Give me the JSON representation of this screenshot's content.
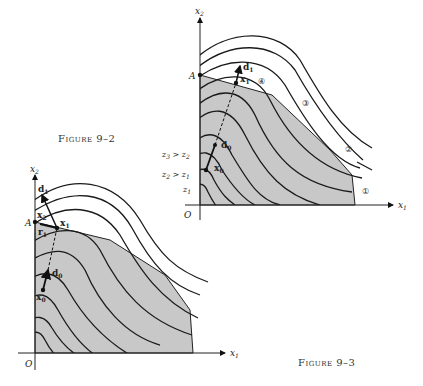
{
  "figures": [
    {
      "id": "fig-9-2",
      "caption": "Figure 9–2",
      "axes": {
        "x": "x",
        "x_sub": "1",
        "y": "x",
        "y_sub": "2",
        "origin": "O"
      },
      "points": {
        "A": "A",
        "x0": "x",
        "x0_sub": "0",
        "x1": "x",
        "x1_sub": "1",
        "d0": "d",
        "d0_sub": "0",
        "d1": "d",
        "d1_sub": "1"
      },
      "level_labels": [
        {
          "text": "z",
          "sub": "3",
          "rel": " > z",
          "rel_sub": "2"
        },
        {
          "text": "z",
          "sub": "2",
          "rel": " > z",
          "rel_sub": "1"
        },
        {
          "text": "z",
          "sub": "1",
          "rel": "",
          "rel_sub": ""
        }
      ],
      "circled_labels": [
        "①",
        "②",
        "③",
        "④"
      ]
    },
    {
      "id": "fig-9-3",
      "caption": "Figure 9–3",
      "axes": {
        "x": "x",
        "x_sub": "1",
        "y": "x",
        "y_sub": "2",
        "origin": "O"
      },
      "points": {
        "A": "A",
        "x0": "x",
        "x0_sub": "0",
        "x1": "x",
        "x1_sub": "1",
        "x2": "x",
        "x2_sub": "2",
        "d0": "d",
        "d0_sub": "0",
        "d1": "d",
        "d1_sub": "1",
        "r1": "r",
        "r1_sub": "1"
      }
    }
  ],
  "colors": {
    "feasible_region": "#c8c8c8",
    "lines": "#1a1a1a",
    "background": "#ffffff"
  }
}
